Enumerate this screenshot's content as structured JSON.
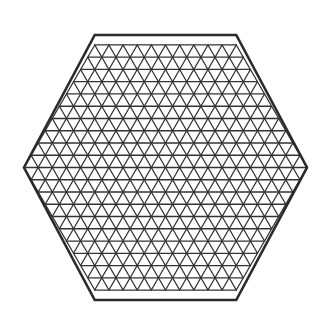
{
  "figure": {
    "type": "geometric-diagram",
    "shape_name": "hexagon",
    "orientation": "flat-top",
    "tessellation": "equilateral-triangle-lattice",
    "background_color": "#ffffff",
    "canvas": {
      "width": 331,
      "height": 333
    }
  },
  "hexagon": {
    "center": {
      "x": 165.5,
      "y": 167.5
    },
    "circumradius": 141.5,
    "subdivisions_per_edge": 10,
    "rows": 20,
    "vertices": [
      {
        "label": "left",
        "x": 24.0,
        "y": 167.5
      },
      {
        "label": "upper-left",
        "x": 94.75,
        "y": 35.0
      },
      {
        "label": "upper-right",
        "x": 236.25,
        "y": 35.0
      },
      {
        "label": "right",
        "x": 307.0,
        "y": 167.5
      },
      {
        "label": "lower-right",
        "x": 236.25,
        "y": 300.0
      },
      {
        "label": "lower-left",
        "x": 94.75,
        "y": 300.0
      }
    ],
    "cell_width": 14.15,
    "row_height": 13.25,
    "cells_top_row": 10,
    "cells_middle_row": 20,
    "triangle_count": 600
  },
  "style": {
    "line_color": "#333333",
    "border_color": "#2b2b2b",
    "interior_stroke_width": 1.3,
    "border_stroke_width": 2.6,
    "fill": "none"
  },
  "chart_data": {
    "type": "diagram",
    "lattice_directions": [
      "horizontal",
      "positive-60-degree",
      "negative-60-degree"
    ],
    "horizontal_line_count": 19,
    "diagonal_line_count_per_direction": 19,
    "grid": true,
    "legend": false,
    "xlabel": "",
    "ylabel": ""
  }
}
